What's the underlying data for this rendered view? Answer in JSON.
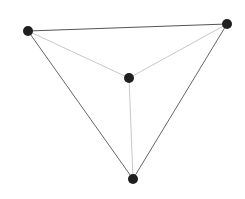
{
  "diagram": {
    "type": "graph",
    "width": 245,
    "height": 199,
    "background": "#ffffff",
    "node_color": "#1f1f1f",
    "node_radius": 5,
    "nodes": [
      {
        "id": "n1",
        "x": 28,
        "y": 31
      },
      {
        "id": "n2",
        "x": 227,
        "y": 24
      },
      {
        "id": "n3",
        "x": 129,
        "y": 78
      },
      {
        "id": "n4",
        "x": 133,
        "y": 179
      }
    ],
    "edges": [
      {
        "from": "n1",
        "to": "n2",
        "color": "#555555",
        "width": 1
      },
      {
        "from": "n1",
        "to": "n4",
        "color": "#666666",
        "width": 1
      },
      {
        "from": "n2",
        "to": "n4",
        "color": "#666666",
        "width": 1
      },
      {
        "from": "n1",
        "to": "n3",
        "color": "#c8c8c8",
        "width": 1
      },
      {
        "from": "n2",
        "to": "n3",
        "color": "#c8c8c8",
        "width": 1
      },
      {
        "from": "n3",
        "to": "n4",
        "color": "#c8c8c8",
        "width": 1
      }
    ]
  }
}
